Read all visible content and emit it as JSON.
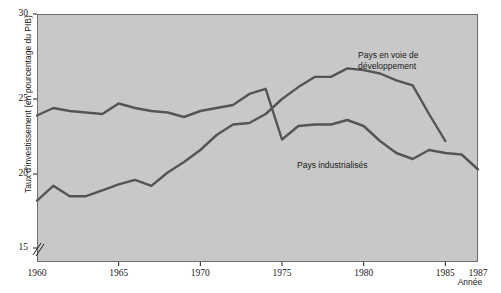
{
  "chart_data": {
    "type": "line",
    "title": "",
    "xlabel": "Année",
    "ylabel": "Taux d'investissement (en pourcentage du PIB)",
    "xlim": [
      1960,
      1987
    ],
    "ylim": [
      15,
      30
    ],
    "y_axis_break": true,
    "grid": false,
    "legend_position": "inline-annotations",
    "xticks": [
      1960,
      1965,
      1970,
      1975,
      1980,
      1985,
      1987
    ],
    "xtick_labels": [
      "1960",
      "1965",
      "1970",
      "1975",
      "1980",
      "1985",
      "1987"
    ],
    "yticks": [
      15,
      20,
      25,
      30
    ],
    "ytick_labels": [
      "15",
      "20",
      "25",
      "30"
    ],
    "series": [
      {
        "name": "Pays industrialisés",
        "label_lines": "Pays industrialisés",
        "color": "#555555",
        "x": [
          1960,
          1961,
          1962,
          1963,
          1964,
          1965,
          1966,
          1967,
          1968,
          1969,
          1970,
          1971,
          1972,
          1973,
          1974,
          1975,
          1976,
          1977,
          1978,
          1979,
          1980,
          1981,
          1982,
          1983,
          1984,
          1985,
          1986,
          1987
        ],
        "values": [
          23.9,
          24.4,
          24.2,
          24.1,
          24.0,
          24.7,
          24.4,
          24.2,
          24.1,
          23.8,
          24.2,
          24.4,
          24.6,
          25.3,
          25.6,
          22.3,
          23.2,
          23.3,
          23.3,
          23.6,
          23.2,
          22.2,
          21.4,
          21.0,
          21.6,
          21.4,
          21.3,
          20.3
        ]
      },
      {
        "name": "Pays en voie de développement",
        "label_lines": "Pays en voie de\ndéveloppement",
        "color": "#555555",
        "x": [
          1960,
          1961,
          1962,
          1963,
          1964,
          1965,
          1966,
          1967,
          1968,
          1969,
          1970,
          1971,
          1972,
          1973,
          1974,
          1975,
          1976,
          1977,
          1978,
          1979,
          1980,
          1981,
          1982,
          1983,
          1984,
          1985
        ],
        "values": [
          18.2,
          19.2,
          18.5,
          18.5,
          18.9,
          19.3,
          19.6,
          19.2,
          20.1,
          20.8,
          21.6,
          22.6,
          23.3,
          23.4,
          24.0,
          25.0,
          25.7,
          26.3,
          26.3,
          26.8,
          26.7,
          26.5,
          26.1,
          25.8,
          24.0,
          22.2
        ]
      }
    ]
  },
  "axes": {
    "y_title": "Taux d'investissement (en pourcentage du PIB)",
    "x_title": "Année"
  },
  "colors": {
    "plot_background": "#c8c8c8",
    "line": "#555555",
    "frame": "#6e6e6e",
    "text": "#1a1a1a",
    "page_background": "#ffffff"
  }
}
